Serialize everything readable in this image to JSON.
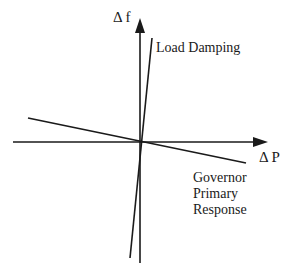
{
  "diagram": {
    "axes": {
      "y_label": "Δ f",
      "x_label": "Δ P"
    },
    "lines": [
      {
        "name": "Load Damping",
        "label_lines": [
          "Load Damping"
        ]
      },
      {
        "name": "Governor Primary Response",
        "label_lines": [
          "Governor",
          "Primary",
          "Response"
        ]
      }
    ],
    "colors": {
      "stroke": "#1a1a1a",
      "background": "#ffffff"
    }
  }
}
